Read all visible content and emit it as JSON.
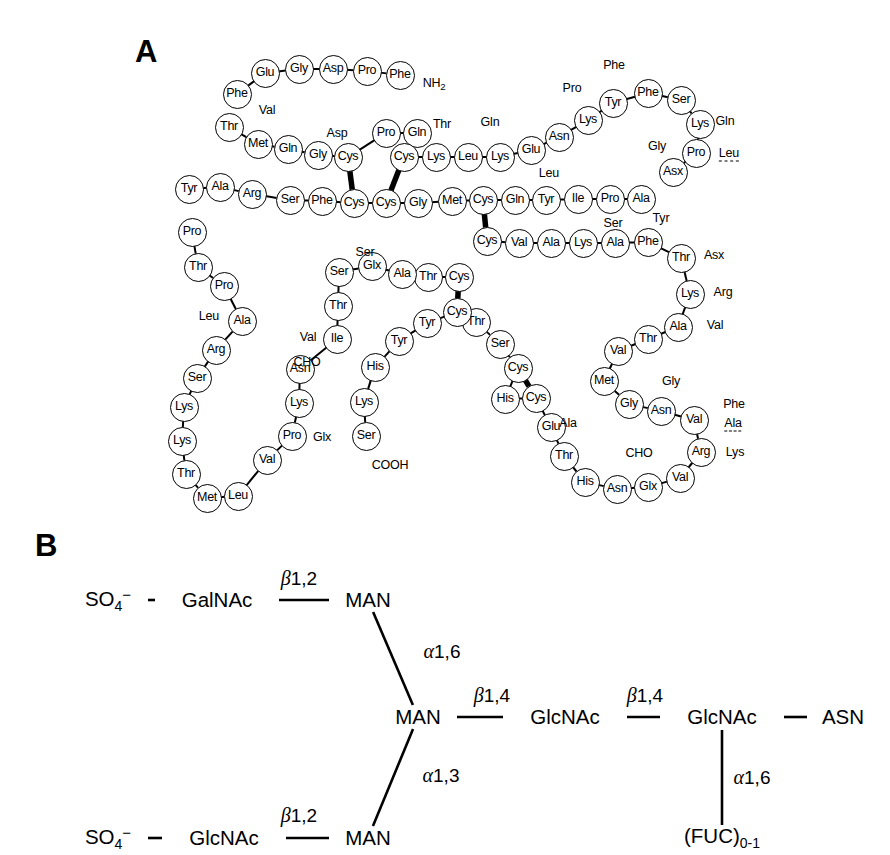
{
  "figure": {
    "panels": [
      {
        "id": "A",
        "letter": "A",
        "kind": "protein-sequence-map"
      },
      {
        "id": "B",
        "letter": "B",
        "kind": "glycan-structure"
      }
    ]
  },
  "panel_a": {
    "letter": "A",
    "terminus_labels": {
      "n_terminus": "NH",
      "n_terminus_sub": "2",
      "c_terminus": "COOH"
    },
    "residues": [
      {
        "id": "r1",
        "label": "Phe",
        "x": 237,
        "y": 94
      },
      {
        "id": "r2",
        "label": "Glu",
        "x": 265,
        "y": 73
      },
      {
        "id": "r3",
        "label": "Gly",
        "x": 299,
        "y": 69
      },
      {
        "id": "r4",
        "label": "Asp",
        "x": 333,
        "y": 69
      },
      {
        "id": "r5",
        "label": "Pro",
        "x": 367,
        "y": 71
      },
      {
        "id": "r6",
        "label": "Phe",
        "x": 400,
        "y": 75
      },
      {
        "id": "r7",
        "label": "Thr",
        "x": 229,
        "y": 127
      },
      {
        "id": "r8",
        "label": "Met",
        "x": 258,
        "y": 144
      },
      {
        "id": "r9",
        "label": "Gln",
        "x": 288,
        "y": 149
      },
      {
        "id": "r10",
        "label": "Gly",
        "x": 318,
        "y": 155
      },
      {
        "id": "r11",
        "label": "Cys",
        "x": 348,
        "y": 157
      },
      {
        "id": "r12",
        "label": "Pro",
        "x": 386,
        "y": 133
      },
      {
        "id": "r13",
        "label": "Gln",
        "x": 417,
        "y": 133
      },
      {
        "id": "r14",
        "label": "Cys",
        "x": 404,
        "y": 157
      },
      {
        "id": "r15",
        "label": "Lys",
        "x": 436,
        "y": 157
      },
      {
        "id": "r16",
        "label": "Leu",
        "x": 468,
        "y": 157
      },
      {
        "id": "r17",
        "label": "Lys",
        "x": 500,
        "y": 157
      },
      {
        "id": "r18",
        "label": "Glu",
        "x": 531,
        "y": 150
      },
      {
        "id": "r19",
        "label": "Asn",
        "x": 559,
        "y": 137
      },
      {
        "id": "r20",
        "label": "Lys",
        "x": 588,
        "y": 120
      },
      {
        "id": "r21",
        "label": "Tyr",
        "x": 613,
        "y": 103
      },
      {
        "id": "r22",
        "label": "Phe",
        "x": 648,
        "y": 93
      },
      {
        "id": "r23",
        "label": "Ser",
        "x": 681,
        "y": 100
      },
      {
        "id": "r24",
        "label": "Lys",
        "x": 700,
        "y": 124
      },
      {
        "id": "r25",
        "label": "Pro",
        "x": 696,
        "y": 153
      },
      {
        "id": "r26",
        "label": "Asx",
        "x": 673,
        "y": 172
      },
      {
        "id": "r27",
        "label": "Tyr",
        "x": 189,
        "y": 189
      },
      {
        "id": "r28",
        "label": "Ala",
        "x": 220,
        "y": 187
      },
      {
        "id": "r29",
        "label": "Arg",
        "x": 252,
        "y": 194
      },
      {
        "id": "r30",
        "label": "Ser",
        "x": 290,
        "y": 200
      },
      {
        "id": "r31",
        "label": "Phe",
        "x": 322,
        "y": 201
      },
      {
        "id": "r32",
        "label": "Cys",
        "x": 354,
        "y": 203
      },
      {
        "id": "r33",
        "label": "Cys",
        "x": 386,
        "y": 203
      },
      {
        "id": "r34",
        "label": "Gly",
        "x": 418,
        "y": 203
      },
      {
        "id": "r35",
        "label": "Met",
        "x": 452,
        "y": 201
      },
      {
        "id": "r36",
        "label": "Cys",
        "x": 483,
        "y": 200
      },
      {
        "id": "r37",
        "label": "Gln",
        "x": 515,
        "y": 200
      },
      {
        "id": "r38",
        "label": "Tyr",
        "x": 546,
        "y": 200
      },
      {
        "id": "r39",
        "label": "Ile",
        "x": 578,
        "y": 199
      },
      {
        "id": "r40",
        "label": "Pro",
        "x": 610,
        "y": 199
      },
      {
        "id": "r41",
        "label": "Ala",
        "x": 641,
        "y": 199
      },
      {
        "id": "r42",
        "label": "Cys",
        "x": 487,
        "y": 241
      },
      {
        "id": "r43",
        "label": "Val",
        "x": 519,
        "y": 243
      },
      {
        "id": "r44",
        "label": "Ala",
        "x": 551,
        "y": 243
      },
      {
        "id": "r45",
        "label": "Lys",
        "x": 583,
        "y": 243
      },
      {
        "id": "r46",
        "label": "Ala",
        "x": 615,
        "y": 243
      },
      {
        "id": "r47",
        "label": "Phe",
        "x": 648,
        "y": 242
      },
      {
        "id": "r48",
        "label": "Thr",
        "x": 681,
        "y": 258
      },
      {
        "id": "r49",
        "label": "Lys",
        "x": 690,
        "y": 294
      },
      {
        "id": "r50",
        "label": "Ala",
        "x": 678,
        "y": 327
      },
      {
        "id": "r51",
        "label": "Thr",
        "x": 648,
        "y": 339
      },
      {
        "id": "r52",
        "label": "Val",
        "x": 618,
        "y": 351
      },
      {
        "id": "r53",
        "label": "Met",
        "x": 604,
        "y": 381
      },
      {
        "id": "r54",
        "label": "Gly",
        "x": 629,
        "y": 404
      },
      {
        "id": "r55",
        "label": "Asn",
        "x": 661,
        "y": 411
      },
      {
        "id": "r56",
        "label": "Val",
        "x": 694,
        "y": 420
      },
      {
        "id": "r57",
        "label": "Arg",
        "x": 701,
        "y": 452
      },
      {
        "id": "r58",
        "label": "Val",
        "x": 680,
        "y": 478
      },
      {
        "id": "r59",
        "label": "Glx",
        "x": 648,
        "y": 487
      },
      {
        "id": "r60",
        "label": "Asn",
        "x": 617,
        "y": 489
      },
      {
        "id": "r61",
        "label": "His",
        "x": 585,
        "y": 482
      },
      {
        "id": "r62",
        "label": "Thr",
        "x": 564,
        "y": 456
      },
      {
        "id": "r63",
        "label": "Glu",
        "x": 551,
        "y": 427
      },
      {
        "id": "r64",
        "label": "Cys",
        "x": 536,
        "y": 398
      },
      {
        "id": "r65",
        "label": "His",
        "x": 505,
        "y": 399
      },
      {
        "id": "r66",
        "label": "Cys",
        "x": 518,
        "y": 368
      },
      {
        "id": "r67",
        "label": "Ser",
        "x": 500,
        "y": 344
      },
      {
        "id": "r68",
        "label": "Thr",
        "x": 476,
        "y": 322
      },
      {
        "id": "r69",
        "label": "Cys",
        "x": 457,
        "y": 312
      },
      {
        "id": "r70",
        "label": "Tyr",
        "x": 427,
        "y": 323
      },
      {
        "id": "r71",
        "label": "Tyr",
        "x": 399,
        "y": 341
      },
      {
        "id": "r72",
        "label": "His",
        "x": 375,
        "y": 367
      },
      {
        "id": "r73",
        "label": "Lys",
        "x": 364,
        "y": 402
      },
      {
        "id": "r74",
        "label": "Ser",
        "x": 366,
        "y": 436
      },
      {
        "id": "r75",
        "label": "Cys",
        "x": 459,
        "y": 277
      },
      {
        "id": "r76",
        "label": "Thr",
        "x": 428,
        "y": 277
      },
      {
        "id": "r77",
        "label": "Ala",
        "x": 402,
        "y": 274
      },
      {
        "id": "r78",
        "label": "Glx",
        "x": 372,
        "y": 266
      },
      {
        "id": "r79",
        "label": "Ser",
        "x": 339,
        "y": 272
      },
      {
        "id": "r80",
        "label": "Thr",
        "x": 338,
        "y": 306
      },
      {
        "id": "r81",
        "label": "Ile",
        "x": 337,
        "y": 339
      },
      {
        "id": "r82",
        "label": "Asn",
        "x": 300,
        "y": 369
      },
      {
        "id": "r83",
        "label": "Lys",
        "x": 299,
        "y": 403
      },
      {
        "id": "r84",
        "label": "Pro",
        "x": 292,
        "y": 436
      },
      {
        "id": "r85",
        "label": "Val",
        "x": 267,
        "y": 460
      },
      {
        "id": "r86",
        "label": "Leu",
        "x": 238,
        "y": 496
      },
      {
        "id": "r87",
        "label": "Met",
        "x": 207,
        "y": 498
      },
      {
        "id": "r88",
        "label": "Thr",
        "x": 186,
        "y": 474
      },
      {
        "id": "r89",
        "label": "Lys",
        "x": 182,
        "y": 441
      },
      {
        "id": "r90",
        "label": "Lys",
        "x": 184,
        "y": 407
      },
      {
        "id": "r91",
        "label": "Ser",
        "x": 197,
        "y": 378
      },
      {
        "id": "r92",
        "label": "Arg",
        "x": 216,
        "y": 350
      },
      {
        "id": "r93",
        "label": "Ala",
        "x": 242,
        "y": 321
      },
      {
        "id": "r94",
        "label": "Pro",
        "x": 224,
        "y": 286
      },
      {
        "id": "r95",
        "label": "Thr",
        "x": 198,
        "y": 267
      },
      {
        "id": "r96",
        "label": "Pro",
        "x": 192,
        "y": 232
      }
    ],
    "free_labels": [
      {
        "id": "f1",
        "label": "NH",
        "sub": "2",
        "x": 434,
        "y": 85,
        "dashed": false
      },
      {
        "id": "f2",
        "label": "Val",
        "x": 267,
        "y": 110,
        "dashed": false
      },
      {
        "id": "f3",
        "label": "Asp",
        "x": 337,
        "y": 133,
        "dashed": false
      },
      {
        "id": "f4",
        "label": "Thr",
        "x": 442,
        "y": 124,
        "dashed": false
      },
      {
        "id": "f5",
        "label": "Gln",
        "x": 490,
        "y": 122,
        "dashed": false
      },
      {
        "id": "f6",
        "label": "Pro",
        "x": 572,
        "y": 88,
        "dashed": false
      },
      {
        "id": "f7",
        "label": "Phe",
        "x": 614,
        "y": 65,
        "dashed": false
      },
      {
        "id": "f8",
        "label": "Gln",
        "x": 725,
        "y": 121,
        "dashed": false
      },
      {
        "id": "f9",
        "label": "Gly",
        "x": 657,
        "y": 146,
        "dashed": false
      },
      {
        "id": "f10",
        "label": "Leu",
        "x": 729,
        "y": 154,
        "dashed": true
      },
      {
        "id": "f11",
        "label": "Leu",
        "x": 549,
        "y": 173,
        "dashed": false
      },
      {
        "id": "f12",
        "label": "Ser",
        "x": 613,
        "y": 223,
        "dashed": false
      },
      {
        "id": "f13",
        "label": "Tyr",
        "x": 661,
        "y": 218,
        "dashed": false
      },
      {
        "id": "f14",
        "label": "Asx",
        "x": 714,
        "y": 255,
        "dashed": false
      },
      {
        "id": "f15",
        "label": "Arg",
        "x": 723,
        "y": 292,
        "dashed": false
      },
      {
        "id": "f16",
        "label": "Val",
        "x": 715,
        "y": 325,
        "dashed": false
      },
      {
        "id": "f17",
        "label": "Gly",
        "x": 671,
        "y": 381,
        "dashed": false
      },
      {
        "id": "f18",
        "label": "Phe",
        "x": 734,
        "y": 404,
        "dashed": false
      },
      {
        "id": "f19",
        "label": "Ala",
        "x": 733,
        "y": 424,
        "dashed": true
      },
      {
        "id": "f20",
        "label": "Lys",
        "x": 735,
        "y": 452,
        "dashed": false
      },
      {
        "id": "f21",
        "label": "CHO",
        "x": 639,
        "y": 453,
        "dashed": false
      },
      {
        "id": "f22",
        "label": "Ala",
        "x": 568,
        "y": 423,
        "dashed": false
      },
      {
        "id": "f23",
        "label": "Ser",
        "x": 365,
        "y": 252,
        "dashed": false
      },
      {
        "id": "f24",
        "label": "Val",
        "x": 308,
        "y": 337,
        "dashed": false
      },
      {
        "id": "f25",
        "label": "CHO",
        "x": 307,
        "y": 362,
        "dashed": false
      },
      {
        "id": "f26",
        "label": "Glx",
        "x": 322,
        "y": 437,
        "dashed": false
      },
      {
        "id": "f27",
        "label": "COOH",
        "x": 390,
        "y": 465,
        "dashed": false
      },
      {
        "id": "f28",
        "label": "Leu",
        "x": 209,
        "y": 316,
        "dashed": false
      }
    ],
    "disulfide_bonds": [
      {
        "id": "ss1",
        "from": "r11",
        "to": "r32",
        "note": "Cys-Cys"
      },
      {
        "id": "ss2",
        "from": "r14",
        "to": "r33",
        "note": "Cys-Cys"
      },
      {
        "id": "ss3",
        "from": "r36",
        "to": "r42",
        "note": "Cys-Cys"
      },
      {
        "id": "ss4",
        "from": "r69",
        "to": "r75",
        "note": "Cys-Cys"
      },
      {
        "id": "ss5",
        "from": "r64",
        "to": "r66",
        "note": "Cys-Cys"
      }
    ]
  },
  "panel_b": {
    "letter": "B",
    "nodes": [
      {
        "id": "b1",
        "label": "SO",
        "sub": "4",
        "sup": "−",
        "x": 108,
        "y": 600
      },
      {
        "id": "b2",
        "label": "GalNAc",
        "x": 217,
        "y": 600
      },
      {
        "id": "b3",
        "label": "MAN",
        "x": 368,
        "y": 600
      },
      {
        "id": "b4",
        "label": "MAN",
        "x": 418,
        "y": 717
      },
      {
        "id": "b5",
        "label": "GlcNAc",
        "x": 565,
        "y": 717
      },
      {
        "id": "b6",
        "label": "GlcNAc",
        "x": 722,
        "y": 717
      },
      {
        "id": "b7",
        "label": "ASN",
        "x": 843,
        "y": 717
      },
      {
        "id": "b8",
        "label": "SO",
        "sub": "4",
        "sup": "−",
        "x": 108,
        "y": 838
      },
      {
        "id": "b9",
        "label": "GlcNAc",
        "x": 224,
        "y": 838
      },
      {
        "id": "b10",
        "label": "MAN",
        "x": 368,
        "y": 838
      },
      {
        "id": "b11",
        "label": "(FUC)",
        "sub": "0-1",
        "x": 722,
        "y": 838
      }
    ],
    "linkages": [
      {
        "id": "l1",
        "greek": "β",
        "text": "1,2",
        "x": 299,
        "y": 578
      },
      {
        "id": "l2",
        "greek": "α",
        "text": "1,6",
        "x": 442,
        "y": 651
      },
      {
        "id": "l3",
        "greek": "β",
        "text": "1,4",
        "x": 492,
        "y": 695
      },
      {
        "id": "l4",
        "greek": "β",
        "text": "1,4",
        "x": 645,
        "y": 695
      },
      {
        "id": "l5",
        "greek": "α",
        "text": "1,3",
        "x": 441,
        "y": 775
      },
      {
        "id": "l6",
        "greek": "α",
        "text": "1,6",
        "x": 752,
        "y": 777
      },
      {
        "id": "l7",
        "greek": "β",
        "text": "1,2",
        "x": 299,
        "y": 815
      }
    ]
  },
  "colors": {
    "ink": "#000000",
    "background": "#ffffff"
  }
}
